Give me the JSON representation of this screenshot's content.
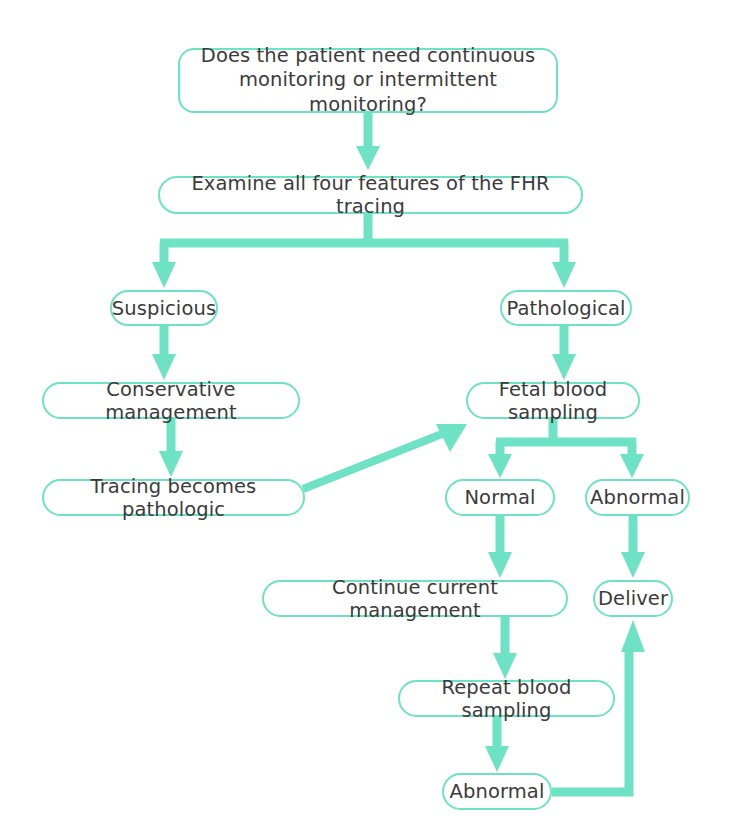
{
  "diagram": {
    "accent_color": "#6EE2C4",
    "text_color": "#3b3b3b",
    "background_color": "#ffffff",
    "nodes": [
      {
        "id": "question",
        "label": "Does the patient need continuous\nmonitoring or intermittent monitoring?",
        "x": 178,
        "y": 48,
        "w": 380,
        "h": 65,
        "shape": "rounded-rect",
        "lines": 2
      },
      {
        "id": "examine",
        "label": "Examine all four features of the FHR tracing",
        "x": 158,
        "y": 176,
        "w": 425,
        "h": 38,
        "shape": "pill",
        "lines": 1
      },
      {
        "id": "suspicious",
        "label": "Suspicious",
        "x": 110,
        "y": 290,
        "w": 108,
        "h": 36,
        "shape": "pill",
        "lines": 1
      },
      {
        "id": "pathological",
        "label": "Pathological",
        "x": 500,
        "y": 290,
        "w": 132,
        "h": 36,
        "shape": "pill",
        "lines": 1
      },
      {
        "id": "conservative-management",
        "label": "Conservative management",
        "x": 42,
        "y": 382,
        "w": 258,
        "h": 37,
        "shape": "pill",
        "lines": 1
      },
      {
        "id": "fetal-blood-sampling",
        "label": "Fetal blood sampling",
        "x": 466,
        "y": 382,
        "w": 174,
        "h": 37,
        "shape": "pill",
        "lines": 1
      },
      {
        "id": "tracing-becomes-pathologic",
        "label": "Tracing becomes pathologic",
        "x": 42,
        "y": 479,
        "w": 263,
        "h": 37,
        "shape": "pill",
        "lines": 1
      },
      {
        "id": "normal",
        "label": "Normal",
        "x": 445,
        "y": 479,
        "w": 110,
        "h": 37,
        "shape": "pill",
        "lines": 1
      },
      {
        "id": "abnormal-first",
        "label": "Abnormal",
        "x": 585,
        "y": 479,
        "w": 105,
        "h": 37,
        "shape": "pill",
        "lines": 1
      },
      {
        "id": "continue-current-management",
        "label": "Continue current management",
        "x": 262,
        "y": 580,
        "w": 306,
        "h": 37,
        "shape": "pill",
        "lines": 1
      },
      {
        "id": "deliver",
        "label": "Deliver",
        "x": 593,
        "y": 580,
        "w": 80,
        "h": 37,
        "shape": "pill",
        "lines": 1
      },
      {
        "id": "repeat-blood-sampling",
        "label": "Repeat blood sampling",
        "x": 398,
        "y": 680,
        "w": 217,
        "h": 37,
        "shape": "pill",
        "lines": 1
      },
      {
        "id": "abnormal-second",
        "label": "Abnormal",
        "x": 442,
        "y": 773,
        "w": 110,
        "h": 37,
        "shape": "pill",
        "lines": 1
      }
    ],
    "edges": [
      {
        "id": "question-to-examine",
        "from": "question",
        "to": "examine",
        "kind": "arrow-down"
      },
      {
        "id": "examine-to-suspicious",
        "from": "examine",
        "to": "suspicious",
        "kind": "split-left"
      },
      {
        "id": "examine-to-pathological",
        "from": "examine",
        "to": "pathological",
        "kind": "split-right"
      },
      {
        "id": "suspicious-to-conservative",
        "from": "suspicious",
        "to": "conservative-management",
        "kind": "arrow-down"
      },
      {
        "id": "conservative-to-tracing",
        "from": "conservative-management",
        "to": "tracing-becomes-pathologic",
        "kind": "arrow-down"
      },
      {
        "id": "tracing-to-fetal-blood-sampling",
        "from": "tracing-becomes-pathologic",
        "to": "fetal-blood-sampling",
        "kind": "arrow-diagonal"
      },
      {
        "id": "pathological-to-fetal-blood-sampling",
        "from": "pathological",
        "to": "fetal-blood-sampling",
        "kind": "arrow-down"
      },
      {
        "id": "fetal-to-normal",
        "from": "fetal-blood-sampling",
        "to": "normal",
        "kind": "split-left"
      },
      {
        "id": "fetal-to-abnormal",
        "from": "fetal-blood-sampling",
        "to": "abnormal-first",
        "kind": "split-right"
      },
      {
        "id": "normal-to-continue",
        "from": "normal",
        "to": "continue-current-management",
        "kind": "arrow-down"
      },
      {
        "id": "abnormal-to-deliver",
        "from": "abnormal-first",
        "to": "deliver",
        "kind": "arrow-down"
      },
      {
        "id": "continue-to-repeat",
        "from": "continue-current-management",
        "to": "repeat-blood-sampling",
        "kind": "arrow-down"
      },
      {
        "id": "repeat-to-abnormal",
        "from": "repeat-blood-sampling",
        "to": "abnormal-second",
        "kind": "arrow-down"
      },
      {
        "id": "abnormal-second-to-deliver",
        "from": "abnormal-second",
        "to": "deliver",
        "kind": "feedback-loop-up"
      }
    ]
  }
}
